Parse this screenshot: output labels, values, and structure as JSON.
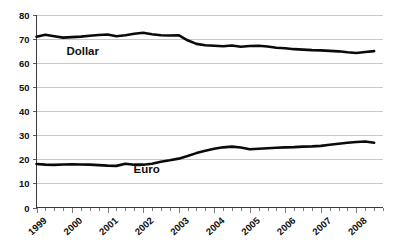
{
  "chart_data": {
    "type": "line",
    "title": "",
    "subtitle": "",
    "xlabel": "",
    "ylabel": "",
    "ylim": [
      0,
      80
    ],
    "ytick_labels": [
      "0",
      "10",
      "20",
      "30",
      "40",
      "50",
      "60",
      "70",
      "80"
    ],
    "ytick_values": [
      0,
      10,
      20,
      30,
      40,
      50,
      60,
      70,
      80
    ],
    "grid": true,
    "legend_position": "inline-annotation",
    "xtick_labels": [
      "1999",
      "2000",
      "2001",
      "2002",
      "2003",
      "2004",
      "2005",
      "2006",
      "2007",
      "2008"
    ],
    "xtick_values": [
      1999,
      2000,
      2001,
      2002,
      2003,
      2004,
      2005,
      2006,
      2007,
      2008
    ],
    "x_minor_ticks_per_year": 4,
    "x": [
      1999.0,
      1999.25,
      1999.5,
      1999.75,
      2000.0,
      2000.25,
      2000.5,
      2000.75,
      2001.0,
      2001.25,
      2001.5,
      2001.75,
      2002.0,
      2002.25,
      2002.5,
      2002.75,
      2003.0,
      2003.25,
      2003.5,
      2003.75,
      2004.0,
      2004.25,
      2004.5,
      2004.75,
      2005.0,
      2005.25,
      2005.5,
      2005.75,
      2006.0,
      2006.25,
      2006.5,
      2006.75,
      2007.0,
      2007.25,
      2007.5,
      2007.75,
      2008.0,
      2008.25,
      2008.5
    ],
    "series": [
      {
        "name": "Dollar",
        "color": "#0a0a0a",
        "label_x": 2000.3,
        "label_y": 63.5,
        "values": [
          71.0,
          71.8,
          71.2,
          70.6,
          70.8,
          71.0,
          71.4,
          71.7,
          71.9,
          71.2,
          71.6,
          72.2,
          72.6,
          72.0,
          71.6,
          71.5,
          71.6,
          69.5,
          68.0,
          67.4,
          67.2,
          67.0,
          67.3,
          66.8,
          67.1,
          67.2,
          66.9,
          66.4,
          66.2,
          65.8,
          65.6,
          65.4,
          65.3,
          65.1,
          64.9,
          64.5,
          64.2,
          64.6,
          65.0
        ]
      },
      {
        "name": "Euro",
        "color": "#0a0a0a",
        "label_x": 2002.1,
        "label_y": 14.5,
        "values": [
          18.1,
          17.8,
          17.7,
          17.9,
          18.0,
          17.9,
          17.8,
          17.6,
          17.4,
          17.3,
          18.2,
          17.8,
          17.8,
          18.2,
          19.0,
          19.6,
          20.3,
          21.4,
          22.6,
          23.6,
          24.4,
          25.0,
          25.3,
          24.9,
          24.2,
          24.4,
          24.6,
          24.8,
          25.0,
          25.1,
          25.3,
          25.4,
          25.6,
          26.1,
          26.5,
          26.9,
          27.2,
          27.4,
          26.9
        ]
      }
    ]
  }
}
